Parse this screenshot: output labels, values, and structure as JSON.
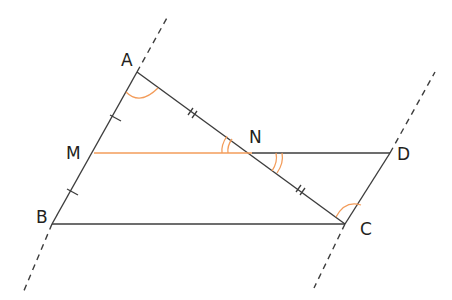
{
  "figure": {
    "type": "geometry-diagram",
    "colors": {
      "line": "#3d3d3d",
      "highlight": "#f39c5a",
      "label": "#231f20"
    },
    "points": [
      {
        "name": "A",
        "x": 137,
        "y": 72
      },
      {
        "name": "B",
        "x": 52,
        "y": 224
      },
      {
        "name": "C",
        "x": 345,
        "y": 224
      },
      {
        "name": "D",
        "x": 390,
        "y": 153
      },
      {
        "name": "M",
        "x": 94,
        "y": 153
      },
      {
        "name": "N",
        "x": 252,
        "y": 153
      }
    ],
    "labels": {
      "A": "A",
      "B": "B",
      "C": "C",
      "D": "D",
      "M": "M",
      "N": "N"
    },
    "segments": [
      "AB",
      "AC",
      "BC",
      "ND",
      "DC"
    ],
    "highlighted_segments": [
      "MN"
    ],
    "dashed_lines": [
      "line AB extended",
      "line DC extended"
    ],
    "equal_marks": {
      "single": [
        "AM",
        "MB"
      ],
      "double": [
        "AN",
        "NC"
      ]
    },
    "angle_marks": {
      "single_arc": [
        "angle MAN",
        "angle NCD"
      ],
      "double_arc": [
        "angle MNA",
        "angle DNC"
      ]
    }
  }
}
